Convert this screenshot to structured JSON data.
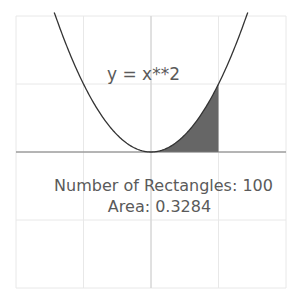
{
  "chart_data": {
    "type": "area",
    "title": "",
    "function": "y = x**2",
    "function_label": "y = x**2",
    "xlim": [
      -2,
      2
    ],
    "ylim": [
      -2,
      2
    ],
    "grid": true,
    "grid_step": 1,
    "shaded_interval": [
      0,
      1
    ],
    "x": [
      -1.4,
      -1.0,
      -0.5,
      0,
      0.5,
      1.0,
      1.4
    ],
    "values": [
      1.96,
      1.0,
      0.25,
      0,
      0.25,
      1.0,
      1.96
    ],
    "annotations": [
      "Number of Rectangles: 100",
      "Area: 0.3284"
    ],
    "colors": {
      "curve": "#333333",
      "fill": "#666666",
      "grid": "#e8e8e8",
      "axis": "#777777",
      "text": "#5a5a5a"
    }
  },
  "labels": {
    "function": "y = x**2",
    "rectangles": "Number of Rectangles: 100",
    "area": "Area: 0.3284"
  }
}
